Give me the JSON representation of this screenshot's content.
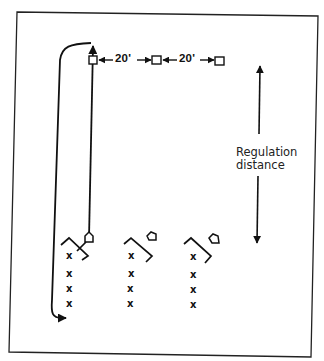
{
  "diagram": {
    "type": "baseball drill layout",
    "distances": [
      {
        "label": "20'"
      },
      {
        "label": "20'"
      }
    ],
    "regulation": {
      "line1": "Regulation",
      "line2": "distance"
    },
    "bases": [
      "base-1",
      "base-2",
      "base-3"
    ],
    "stations": [
      {
        "name": "station-1",
        "players": [
          "x",
          "x",
          "x",
          "x"
        ]
      },
      {
        "name": "station-2",
        "players": [
          "x",
          "x",
          "x",
          "x"
        ]
      },
      {
        "name": "station-3",
        "players": [
          "x",
          "x",
          "x",
          "x"
        ]
      }
    ],
    "colors": {
      "ink": "#111111",
      "background": "#ffffff"
    }
  }
}
